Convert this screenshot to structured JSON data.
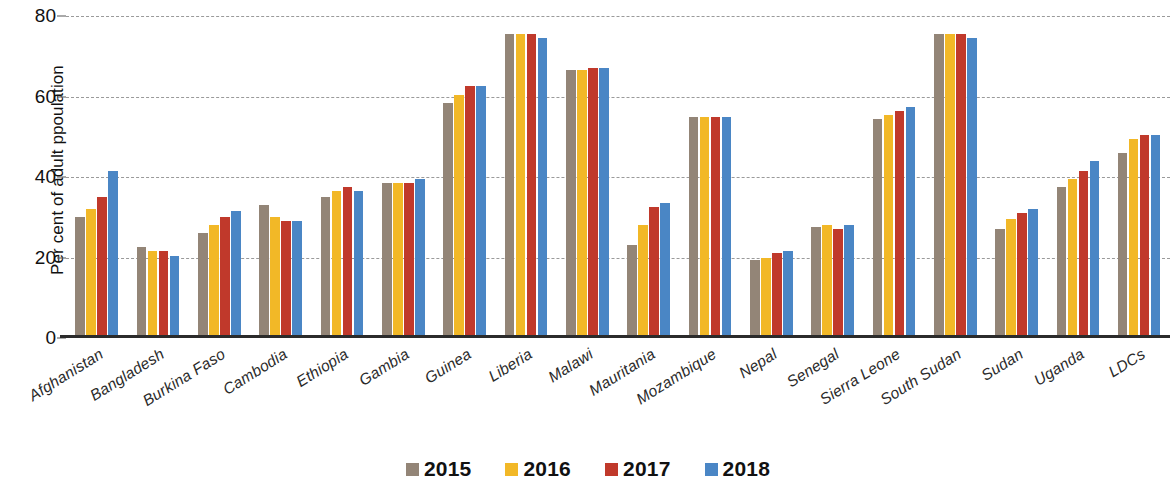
{
  "chart_data": {
    "type": "bar",
    "title": "",
    "subtitle": "",
    "xlabel": "",
    "ylabel": "Per cent of adult ppoulation",
    "ylim": [
      0,
      80
    ],
    "yticks": [
      0,
      20,
      40,
      60,
      80
    ],
    "grid": true,
    "legend_position": "bottom",
    "categories": [
      "Afghanistan",
      "Bangladesh",
      "Burkina Faso",
      "Cambodia",
      "Ethiopia",
      "Gambia",
      "Guinea",
      "Liberia",
      "Malawi",
      "Mauritania",
      "Mozambique",
      "Nepal",
      "Senegal",
      "Sierra Leone",
      "South Sudan",
      "Sudan",
      "Uganda",
      "LDCs"
    ],
    "series": [
      {
        "name": "2015",
        "color": "#938577",
        "values": [
          30.0,
          22.5,
          26.0,
          33.0,
          35.0,
          38.5,
          58.5,
          75.5,
          66.5,
          23.0,
          55.0,
          19.5,
          27.5,
          54.5,
          75.5,
          27.0,
          37.5,
          46.0
        ]
      },
      {
        "name": "2016",
        "color": "#f2b827",
        "values": [
          32.0,
          21.5,
          28.0,
          30.0,
          36.5,
          38.5,
          60.5,
          75.5,
          66.5,
          28.0,
          55.0,
          20.0,
          28.0,
          55.5,
          75.5,
          29.5,
          39.5,
          49.5
        ]
      },
      {
        "name": "2017",
        "color": "#c0392b",
        "values": [
          35.0,
          21.5,
          30.0,
          29.0,
          37.5,
          38.5,
          62.5,
          75.5,
          67.0,
          32.5,
          55.0,
          21.0,
          27.0,
          56.5,
          75.5,
          31.0,
          41.5,
          50.5
        ]
      },
      {
        "name": "2018",
        "color": "#4a86c5",
        "values": [
          41.5,
          20.5,
          31.5,
          29.0,
          36.5,
          39.5,
          62.5,
          74.5,
          67.0,
          33.5,
          55.0,
          21.5,
          28.0,
          57.5,
          74.5,
          32.0,
          44.0,
          50.5
        ]
      }
    ]
  },
  "legend": {
    "items": [
      {
        "label": "2015",
        "color": "#938577"
      },
      {
        "label": "2016",
        "color": "#f2b827"
      },
      {
        "label": "2017",
        "color": "#c0392b"
      },
      {
        "label": "2018",
        "color": "#4a86c5"
      }
    ]
  }
}
